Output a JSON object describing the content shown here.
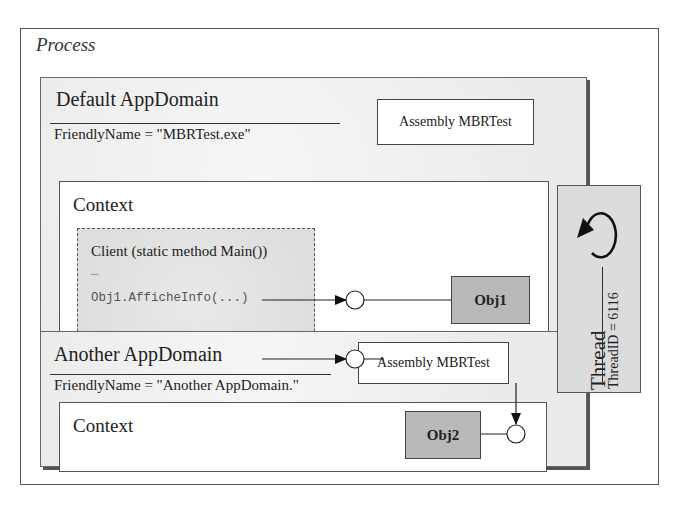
{
  "process": {
    "label": "Process"
  },
  "default_appdomain": {
    "title": "Default AppDomain",
    "friendly_name": "FriendlyName = \"MBRTest.exe\"",
    "assembly": "Assembly MBRTest",
    "context": {
      "label": "Context",
      "client": {
        "title": "Client (static method Main())",
        "ellipsis_1": "...",
        "call_1": "Obj1.AfficheInfo(...)",
        "ellipsis_2": "...",
        "call_2": "Obj2.AfficheInfo(...)"
      },
      "obj1": "Obj1",
      "proxy": "Proxy to Obj2"
    }
  },
  "another_appdomain": {
    "title": "Another AppDomain",
    "friendly_name": "FriendlyName = \"Another AppDomain.\"",
    "assembly": "Assembly MBRTest",
    "context": {
      "label": "Context",
      "obj2": "Obj2"
    }
  },
  "thread": {
    "label": "Thread",
    "thread_id": "ThreadID = 6116"
  },
  "icons": {
    "loop": "circular-arrow-icon",
    "interface": "lollipop-circle-icon",
    "arrow": "arrowhead-icon"
  },
  "colors": {
    "object_fill": "#b9b9b9",
    "appdomain_fill": "#ececec",
    "thread_fill": "#dcdcdc",
    "client_fill": "#e4e4e4",
    "line": "#222222"
  }
}
